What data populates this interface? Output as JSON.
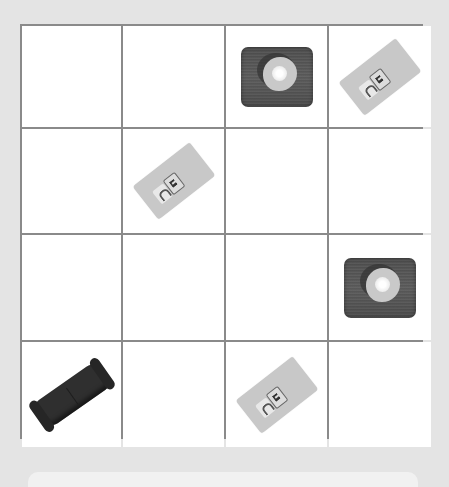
{
  "board": {
    "rows": 4,
    "columns": 4,
    "cells": [
      [
        "empty",
        "empty",
        "wood-mat-with-plate",
        "card"
      ],
      [
        "empty",
        "card",
        "empty",
        "empty"
      ],
      [
        "empty",
        "empty",
        "empty",
        "wood-mat-with-plate"
      ],
      [
        "sofa",
        "empty",
        "card",
        "empty"
      ]
    ]
  },
  "colors": {
    "background": "#e4e4e4",
    "grid_line": "#8a8a8a",
    "cell": "#ffffff",
    "wood_mat": "#545454",
    "card": "#c8c8c8",
    "sofa": "#2f2f2f",
    "bottom_panel": "#f1f1f1"
  }
}
